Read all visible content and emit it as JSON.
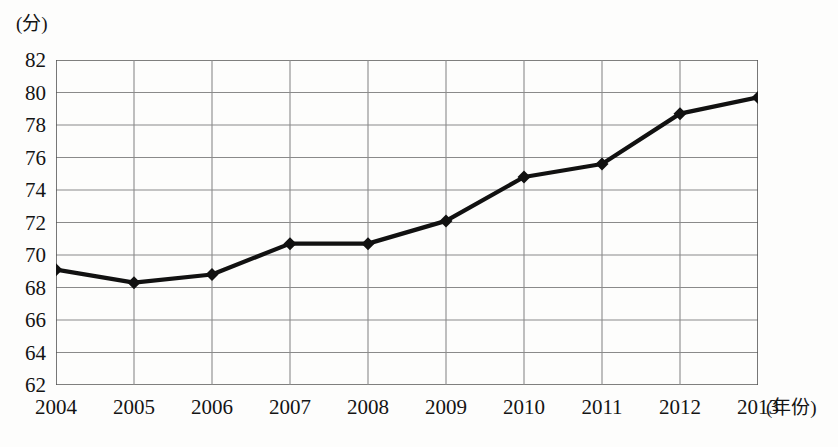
{
  "chart_data": {
    "type": "line",
    "title": "",
    "xlabel": "年份",
    "ylabel": "分",
    "x_unit_label": "(年份)",
    "y_unit_label": "(分)",
    "categories": [
      "2004",
      "2005",
      "2006",
      "2007",
      "2008",
      "2009",
      "2010",
      "2011",
      "2012",
      "2013"
    ],
    "values": [
      69.1,
      68.3,
      68.8,
      70.7,
      70.7,
      72.1,
      74.8,
      75.6,
      78.7,
      79.7
    ],
    "series": [
      {
        "name": "得分",
        "values": [
          69.1,
          68.3,
          68.8,
          70.7,
          70.7,
          72.1,
          74.8,
          75.6,
          78.7,
          79.7
        ]
      }
    ],
    "ylim": [
      62,
      82
    ],
    "yticks": [
      82,
      80,
      78,
      76,
      74,
      72,
      70,
      68,
      66,
      64,
      62
    ],
    "xticks": [
      "2004",
      "2005",
      "2006",
      "2007",
      "2008",
      "2009",
      "2010",
      "2011",
      "2012",
      "2013"
    ],
    "grid": true,
    "legend": "none",
    "marker": "diamond",
    "line_color": "#111111",
    "grid_color": "#8a8a8a",
    "frame_color": "#555555",
    "background_color": "#fdfdfc"
  }
}
